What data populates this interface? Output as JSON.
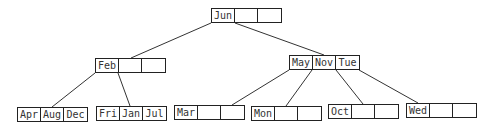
{
  "diagram": {
    "type": "b-tree",
    "nodes": [
      {
        "id": "root",
        "keys": [
          "Jun",
          "",
          ""
        ],
        "x": 211,
        "y": 8
      },
      {
        "id": "n-feb",
        "keys": [
          "Feb",
          "",
          ""
        ],
        "x": 95,
        "y": 58
      },
      {
        "id": "n-may",
        "keys": [
          "May",
          "Nov",
          "Tue"
        ],
        "x": 289,
        "y": 55
      },
      {
        "id": "leaf-1",
        "keys": [
          "Apr",
          "Aug",
          "Dec"
        ],
        "x": 17,
        "y": 107
      },
      {
        "id": "leaf-2",
        "keys": [
          "Fri",
          "Jan",
          "Jul"
        ],
        "x": 96,
        "y": 106
      },
      {
        "id": "leaf-3",
        "keys": [
          "Mar",
          "",
          ""
        ],
        "x": 174,
        "y": 105
      },
      {
        "id": "leaf-4",
        "keys": [
          "Mon",
          "",
          ""
        ],
        "x": 251,
        "y": 106
      },
      {
        "id": "leaf-5",
        "keys": [
          "Oct",
          "",
          ""
        ],
        "x": 328,
        "y": 104
      },
      {
        "id": "leaf-6",
        "keys": [
          "Wed",
          "",
          ""
        ],
        "x": 406,
        "y": 103
      }
    ],
    "edges": [
      {
        "from": "root",
        "to": "n-feb"
      },
      {
        "from": "root",
        "to": "n-may"
      },
      {
        "from": "n-feb",
        "to": "leaf-1"
      },
      {
        "from": "n-feb",
        "to": "leaf-2"
      },
      {
        "from": "n-may",
        "to": "leaf-3"
      },
      {
        "from": "n-may",
        "to": "leaf-4"
      },
      {
        "from": "n-may",
        "to": "leaf-5"
      },
      {
        "from": "n-may",
        "to": "leaf-6"
      }
    ]
  }
}
